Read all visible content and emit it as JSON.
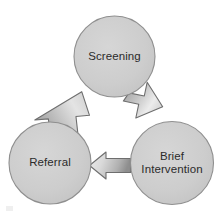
{
  "diagram": {
    "background_color": "#ffffff",
    "node_fill_color": "#cdcdcd",
    "node_stroke_color": "#8f8f8f",
    "label_color": "#2b2b2b",
    "arrow_light_color": "#e6e6e6",
    "arrow_dark_color": "#8a8a8a",
    "arrow_stroke_color": "#6e6e6e",
    "nodes": [
      {
        "id": "screening",
        "label": "Screening",
        "lines": [
          "Screening"
        ],
        "cx": 114.5,
        "cy": 56.5,
        "r": 40.5
      },
      {
        "id": "brief-intervention",
        "label": "Brief Intervention",
        "lines": [
          "Brief",
          "Intervention"
        ],
        "cx": 172.0,
        "cy": 163.0,
        "r": 41.5
      },
      {
        "id": "referral",
        "label": "Referral",
        "lines": [
          "Referral"
        ],
        "cx": 50.0,
        "cy": 163.0,
        "r": 41.0
      }
    ],
    "arrows": [
      {
        "id": "screening-to-brief-intervention",
        "from": "screening",
        "to": "brief-intervention",
        "direction": "down-right"
      },
      {
        "id": "brief-intervention-to-referral",
        "from": "brief-intervention",
        "to": "referral",
        "direction": "left"
      },
      {
        "id": "referral-to-screening",
        "from": "referral",
        "to": "screening",
        "direction": "up-right"
      }
    ]
  }
}
